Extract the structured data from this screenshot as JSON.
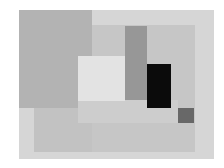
{
  "artwork": {
    "type": "abstract geometric composition",
    "palette": "grayscale",
    "shapes": [
      {
        "name": "outer-frame",
        "x": 19,
        "y": 10,
        "w": 195,
        "h": 149,
        "color": "#d6d6d6"
      },
      {
        "name": "right-panel",
        "x": 92,
        "y": 25,
        "w": 103,
        "h": 127,
        "color": "#c6c6c6"
      },
      {
        "name": "top-left-block",
        "x": 19,
        "y": 10,
        "w": 73,
        "h": 98,
        "color": "#b3b3b3"
      },
      {
        "name": "lower-left-panel",
        "x": 34,
        "y": 108,
        "w": 58,
        "h": 44,
        "color": "#c2c2c2"
      },
      {
        "name": "lower-band",
        "x": 78,
        "y": 100,
        "w": 100,
        "h": 23,
        "color": "#cdcdcd"
      },
      {
        "name": "light-rectangle",
        "x": 78,
        "y": 56,
        "w": 47,
        "h": 45,
        "color": "#e3e3e3"
      },
      {
        "name": "gray-vertical-bar",
        "x": 125,
        "y": 26,
        "w": 22,
        "h": 74,
        "color": "#979797"
      },
      {
        "name": "black-rectangle",
        "x": 147,
        "y": 64,
        "w": 24,
        "h": 44,
        "color": "#0b0b0b"
      },
      {
        "name": "small-dark-square",
        "x": 178,
        "y": 108,
        "w": 16,
        "h": 15,
        "color": "#686868"
      }
    ]
  }
}
